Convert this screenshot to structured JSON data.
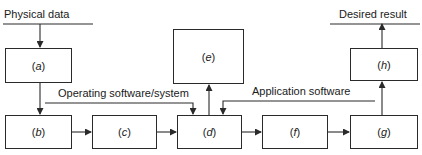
{
  "diagram": {
    "input_label": "Physical data",
    "output_label": "Desired result",
    "operating_label": "Operating software/system",
    "application_label": "Application software",
    "boxes": [
      {
        "id": "a",
        "open": "(",
        "letter": "a",
        "close": ")"
      },
      {
        "id": "b",
        "open": "(",
        "letter": "b",
        "close": ")"
      },
      {
        "id": "c",
        "open": "(",
        "letter": "c",
        "close": ")"
      },
      {
        "id": "d",
        "open": "(",
        "letter": "d",
        "close": ")"
      },
      {
        "id": "e",
        "open": "(",
        "letter": "e",
        "close": ")"
      },
      {
        "id": "f",
        "open": "(",
        "letter": "f",
        "close": ")"
      },
      {
        "id": "g",
        "open": "(",
        "letter": "g",
        "close": ")"
      },
      {
        "id": "h",
        "open": "(",
        "letter": "h",
        "close": ")"
      }
    ],
    "connections": [
      {
        "from": "Physical data",
        "to": "a"
      },
      {
        "from": "a",
        "to": "b"
      },
      {
        "from": "b",
        "to": "c"
      },
      {
        "from": "c",
        "to": "d"
      },
      {
        "from": "Operating software/system",
        "to": "d"
      },
      {
        "from": "Application software",
        "to": "d"
      },
      {
        "from": "d",
        "to": "e"
      },
      {
        "from": "d",
        "to": "f"
      },
      {
        "from": "f",
        "to": "g"
      },
      {
        "from": "g",
        "to": "h"
      },
      {
        "from": "h",
        "to": "Desired result"
      }
    ],
    "line_color": "#2a2a2a"
  }
}
